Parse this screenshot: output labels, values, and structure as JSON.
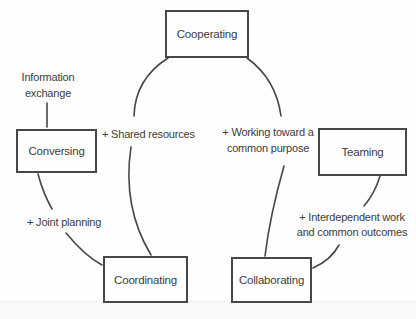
{
  "colors": {
    "background": "#fefefe",
    "line": "#474747",
    "text": "#3c3c3c",
    "box_fill": "#fefefe",
    "divider": "#e9e9e9",
    "footer_tint": "#fafafa"
  },
  "boxes": {
    "cooperating": "Cooperating",
    "conversing": "Conversing",
    "teaming": "Teaming",
    "coordinating": "Coordinating",
    "collaborating": "Collaborating"
  },
  "labels": {
    "information_exchange": {
      "line1": "Information",
      "line2": "exchange"
    },
    "shared_resources": "+ Shared resources",
    "working_toward": {
      "line1": "+ Working toward a",
      "line2": "common purpose"
    },
    "joint_planning": "+ Joint planning",
    "interdependent": {
      "line1": "+ Interdependent work",
      "line2": "and common outcomes"
    }
  }
}
